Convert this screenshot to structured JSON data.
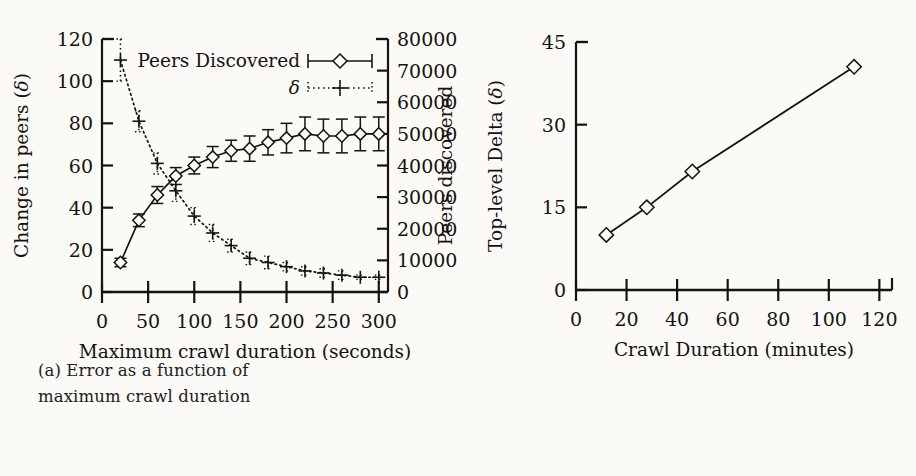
{
  "figure": {
    "background_color": "#fbfaf7",
    "ink_color": "#15130f"
  },
  "panel_a": {
    "caption_label": "(a)",
    "caption_line1": "(a) Error as a function of",
    "caption_line2": "maximum crawl duration",
    "left_axis_title": "Change in peers (δ)",
    "right_axis_title": "Peers discovered",
    "x_axis_title": "Maximum crawl duration (seconds)",
    "legend": [
      {
        "label": "Peers Discovered",
        "marker": "diamond-errorbar",
        "line_style": "solid"
      },
      {
        "label": "δ",
        "marker": "plus",
        "line_style": "dotted"
      }
    ]
  },
  "panel_b": {
    "caption_label": "(b)",
    "caption_line1": "(b) Error as a function of crawling",
    "caption_line2": "speed",
    "y_axis_title": "Top-level Delta (δ)",
    "x_axis_title": "Crawl Duration (minutes)"
  },
  "chart_data": [
    {
      "type": "line",
      "id": "panel-a",
      "title": "",
      "caption": "(a) Error as a function of maximum crawl duration",
      "xlabel": "Maximum crawl duration (seconds)",
      "ylabel": "Change in peers (δ)",
      "y2label": "Peers discovered",
      "xlim": [
        0,
        310
      ],
      "xticks": [
        0,
        50,
        100,
        150,
        200,
        250,
        300
      ],
      "xticklabels": [
        "0",
        "50",
        "100",
        "150",
        "200",
        "250",
        "300"
      ],
      "ylim": [
        0,
        120
      ],
      "yticks": [
        0,
        20,
        40,
        60,
        80,
        100,
        120
      ],
      "yticklabels": [
        "0",
        "20",
        "40",
        "60",
        "80",
        "100",
        "120"
      ],
      "y2lim": [
        0,
        800000
      ],
      "y2ticks": [
        0,
        100000,
        200000,
        300000,
        400000,
        500000,
        600000,
        700000,
        800000
      ],
      "y2ticklabels": [
        "0",
        "100000",
        "200000",
        "300000",
        "400000",
        "500000",
        "600000",
        "700000",
        "800000"
      ],
      "grid": false,
      "legend_position": "top-center",
      "series": [
        {
          "name": "Peers Discovered",
          "axis": "right",
          "marker": "diamond",
          "line_style": "solid",
          "error_bars": true,
          "x": [
            20,
            40,
            60,
            80,
            100,
            120,
            140,
            160,
            180,
            200,
            220,
            240,
            260,
            280,
            300
          ],
          "y_left_scale": [
            14,
            34,
            46,
            55,
            60,
            64,
            67,
            68,
            71,
            73,
            75,
            74,
            74,
            75,
            75
          ],
          "values": [
            93000,
            227000,
            307000,
            367000,
            400000,
            427000,
            447000,
            453000,
            473000,
            487000,
            500000,
            493000,
            493000,
            500000,
            500000
          ],
          "y_error_left_scale": [
            2,
            3,
            4,
            4,
            4,
            5,
            5,
            6,
            6,
            7,
            8,
            8,
            8,
            8,
            8
          ],
          "y_error": [
            13000,
            20000,
            27000,
            27000,
            27000,
            33000,
            33000,
            40000,
            40000,
            47000,
            53000,
            53000,
            53000,
            53000,
            53000
          ]
        },
        {
          "name": "δ",
          "axis": "left",
          "marker": "plus",
          "line_style": "dotted",
          "error_bars": true,
          "x": [
            20,
            40,
            60,
            80,
            100,
            120,
            140,
            160,
            180,
            200,
            220,
            240,
            260,
            280,
            300
          ],
          "values": [
            110,
            81,
            61,
            48,
            36,
            28,
            22,
            16,
            14,
            12,
            10,
            9,
            8,
            7,
            7
          ],
          "y_error": [
            10,
            5,
            5,
            5,
            4,
            4,
            3,
            3,
            3,
            2,
            2,
            2,
            2,
            1,
            1
          ]
        }
      ]
    },
    {
      "type": "scatter",
      "id": "panel-b",
      "title": "",
      "caption": "(b) Error as a function of crawling speed",
      "xlabel": "Crawl Duration (minutes)",
      "ylabel": "Top-level Delta (δ)",
      "xlim": [
        0,
        125
      ],
      "xticks": [
        0,
        20,
        40,
        60,
        80,
        100,
        120
      ],
      "xticklabels": [
        "0",
        "20",
        "40",
        "60",
        "80",
        "100",
        "120"
      ],
      "ylim": [
        0,
        45
      ],
      "yticks": [
        0,
        15,
        30,
        45
      ],
      "yticklabels": [
        "0",
        "15",
        "30",
        "45"
      ],
      "grid": false,
      "legend_position": "none",
      "series": [
        {
          "name": "Top-level Delta",
          "marker": "diamond",
          "line_style": "solid",
          "x": [
            12,
            28,
            46,
            110
          ],
          "values": [
            10,
            15,
            21.5,
            40.5
          ]
        }
      ]
    }
  ]
}
